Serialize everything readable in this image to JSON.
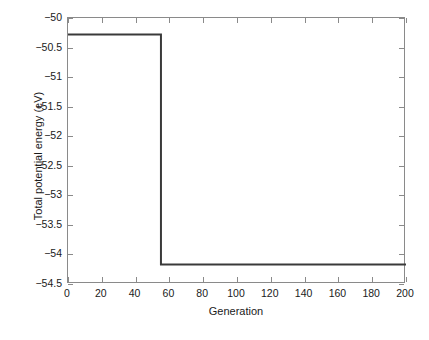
{
  "chart_data": {
    "type": "line",
    "title": "",
    "xlabel": "Generation",
    "ylabel": "Total potential energy (eV)",
    "xlim": [
      0,
      200
    ],
    "ylim": [
      -54.5,
      -50
    ],
    "grid": false,
    "legend": null,
    "xticks": [
      0,
      20,
      40,
      60,
      80,
      100,
      120,
      140,
      160,
      180,
      200
    ],
    "xticklabels": [
      "0",
      "20",
      "40",
      "60",
      "80",
      "100",
      "120",
      "140",
      "160",
      "180",
      "200"
    ],
    "yticks": [
      -54.5,
      -54,
      -53.5,
      -53,
      -52.5,
      -52,
      -51.5,
      -51,
      -50.5,
      -50
    ],
    "yticklabels": [
      "-54.5",
      "-54",
      "-53.5",
      "-53",
      "-52.5",
      "-52",
      "-51.5",
      "-51",
      "-50.5",
      "-50"
    ],
    "series": [
      {
        "name": "Total potential energy",
        "color": "#3a3a3a",
        "linewidth": 2,
        "description": "Step function: constant at -50.28 eV from generation 0 to 55, drops vertically to -54.17 eV at generation 55, then constant at -54.17 eV to generation 200.",
        "x": [
          0,
          55,
          55,
          200
        ],
        "y": [
          -50.28,
          -50.28,
          -54.17,
          -54.17
        ]
      }
    ],
    "annotations": []
  },
  "axes": {
    "x_tick_labels": [
      "0",
      "20",
      "40",
      "60",
      "80",
      "100",
      "120",
      "140",
      "160",
      "180",
      "200"
    ],
    "y_tick_labels": [
      "-50",
      "-50.5",
      "-51",
      "-51.5",
      "-52",
      "-52.5",
      "-53",
      "-53.5",
      "-54",
      "-54.5"
    ],
    "x_axis_label": "Generation",
    "y_axis_label": "Total potential energy (eV)"
  },
  "colors": {
    "line": "#3a3a3a",
    "axis": "#8a8a8a",
    "text": "#1a1a1a",
    "background": "#ffffff"
  }
}
